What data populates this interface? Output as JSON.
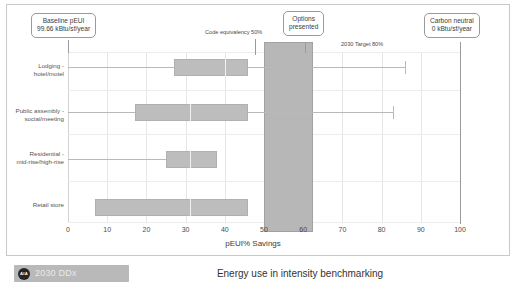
{
  "chart_data": {
    "type": "bar",
    "title": "Energy use in intensity benchmarking",
    "xlabel": "pEUI% Savings",
    "ylabel": "",
    "xlim": [
      0,
      100
    ],
    "xticks": [
      0,
      10,
      20,
      30,
      40,
      50,
      60,
      70,
      80,
      90,
      100
    ],
    "grid": true,
    "legend": "none",
    "orientation": "horizontal",
    "plot_style": "box-and-whisker",
    "categories": [
      "Lodging - hotel/motel",
      "Public assembly - social/meeting",
      "Residential - mid-rise/high-rise",
      "Retail store"
    ],
    "series": [
      {
        "name": "pEUI% Savings distribution",
        "boxes": [
          {
            "category": "Lodging - hotel/motel",
            "whisker_low": 0,
            "q1": 27,
            "median": 40,
            "q3": 46,
            "whisker_high": 86
          },
          {
            "category": "Public assembly - social/meeting",
            "whisker_low": 0,
            "q1": 17,
            "median": 31,
            "q3": 46,
            "whisker_high": 83
          },
          {
            "category": "Residential - mid-rise/high-rise",
            "whisker_low": 0,
            "q1": 25,
            "median": 31,
            "q3": 38,
            "whisker_high": 38
          },
          {
            "category": "Retail store",
            "whisker_low": 7,
            "q1": 7,
            "median": 31,
            "q3": 46,
            "whisker_high": 46
          }
        ]
      }
    ],
    "highlight_band": {
      "label": "Options presented",
      "start": 50,
      "end": 62.5
    },
    "reference_annotations": [
      {
        "label": "Code equivalency 50%",
        "value": 50
      },
      {
        "label": "2030 Target 80%",
        "value": 80
      }
    ],
    "callouts": [
      {
        "id": "baseline",
        "line1": "Baseline pEUI",
        "line2": "99.66 kBtu/sf/year",
        "value": 0
      },
      {
        "id": "options",
        "line1": "Options",
        "line2": "presented",
        "value": 56
      },
      {
        "id": "carbon-neutral",
        "line1": "Carbon neutral",
        "line2": "0 kBtu/sf/year",
        "value": 100
      }
    ]
  },
  "axis": {
    "xtick_labels": [
      "0",
      "10",
      "20",
      "30",
      "40",
      "50",
      "60",
      "70",
      "80",
      "90",
      "100"
    ],
    "xaxis_title": "pEUI% Savings"
  },
  "categories": {
    "lodging": {
      "line1": "Lodging -",
      "line2": "hotel/motel"
    },
    "assembly": {
      "line1": "Public assembly -",
      "line2": "social/meeting"
    },
    "residential": {
      "line1": "Residential -",
      "line2": "mid-rise/high-rise"
    },
    "retail": {
      "line1": "Retail store",
      "line2": ""
    }
  },
  "annotations": {
    "code_equivalency": "Code equivalency 50%",
    "target_2030": "2030 Target 80%"
  },
  "callouts": {
    "baseline": {
      "line1": "Baseline pEUI",
      "line2": "99.66 kBtu/sf/year"
    },
    "options": {
      "line1": "Options",
      "line2": "presented"
    },
    "carbon": {
      "line1": "Carbon neutral",
      "line2": "0 kBtu/sf/year"
    }
  },
  "footer": {
    "badge_mark": "AIA",
    "badge_label": "2030 DDx",
    "title": "Energy use in intensity benchmarking"
  },
  "colors": {
    "box_fill": "#bdbdbd",
    "band_fill": "#b4b4b4",
    "grid": "#e6e6e6",
    "text": "#3a3a3a",
    "badge_bg": "#b9b9b9"
  }
}
